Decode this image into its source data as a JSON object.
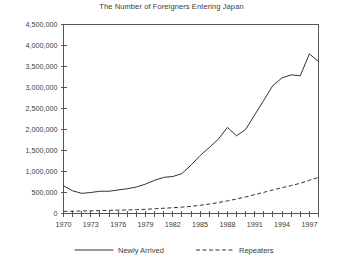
{
  "chart_data": {
    "type": "line",
    "title": "The Number of Foreigners Entering Japan",
    "xlabel": "",
    "ylabel": "",
    "xlim": [
      1970,
      1998
    ],
    "ylim": [
      0,
      4500000
    ],
    "ytick_labels": [
      "0",
      "500,000",
      "1,000,000",
      "1,500,000",
      "2,000,000",
      "2,500,000",
      "3,000,000",
      "3,500,000",
      "4,000,000",
      "4,500,000"
    ],
    "ytick_values": [
      0,
      500000,
      1000000,
      1500000,
      2000000,
      2500000,
      3000000,
      3500000,
      4000000,
      4500000
    ],
    "xtick_labels": [
      "1970",
      "1973",
      "1976",
      "1979",
      "1982",
      "1985",
      "1988",
      "1991",
      "1994",
      "1997"
    ],
    "xtick_values": [
      1970,
      1973,
      1976,
      1979,
      1982,
      1985,
      1988,
      1991,
      1994,
      1997
    ],
    "minor_xticks": [
      1970,
      1971,
      1972,
      1973,
      1974,
      1975,
      1976,
      1977,
      1978,
      1979,
      1980,
      1981,
      1982,
      1983,
      1984,
      1985,
      1986,
      1987,
      1988,
      1989,
      1990,
      1991,
      1992,
      1993,
      1994,
      1995,
      1996,
      1997,
      1998
    ],
    "grid": false,
    "legend_position": "bottom",
    "x": [
      1970,
      1971,
      1972,
      1973,
      1974,
      1975,
      1976,
      1977,
      1978,
      1979,
      1980,
      1981,
      1982,
      1983,
      1984,
      1985,
      1986,
      1987,
      1988,
      1989,
      1990,
      1991,
      1992,
      1993,
      1994,
      1995,
      1996,
      1997,
      1998
    ],
    "series": [
      {
        "name": "Newly Arrived",
        "style": "solid",
        "color": "#333333",
        "values": [
          660000,
          540000,
          480000,
          500000,
          530000,
          530000,
          560000,
          590000,
          630000,
          700000,
          790000,
          860000,
          880000,
          950000,
          1150000,
          1380000,
          1570000,
          1770000,
          2050000,
          1850000,
          2000000,
          2350000,
          2700000,
          3050000,
          3230000,
          3300000,
          3280000,
          3300000,
          3200000
        ]
      },
      {
        "name": "Repeaters",
        "style": "dashed",
        "color": "#333333",
        "values": [
          50000,
          55000,
          60000,
          65000,
          70000,
          75000,
          80000,
          85000,
          92000,
          100000,
          112000,
          125000,
          138000,
          152000,
          170000,
          195000,
          225000,
          260000,
          300000,
          345000,
          395000,
          450000,
          505000,
          560000,
          615000,
          665000,
          720000,
          790000,
          860000
        ]
      }
    ],
    "extra_points": {
      "newly_arrived_tail": [
        [
          1995,
          3300000
        ],
        [
          1996,
          3280000
        ],
        [
          1997,
          3800000
        ],
        [
          1998,
          3620000
        ]
      ]
    }
  },
  "legend": {
    "items": [
      {
        "label": "Newly Arrived",
        "style": "solid"
      },
      {
        "label": "Repeaters",
        "style": "dashed"
      }
    ]
  }
}
